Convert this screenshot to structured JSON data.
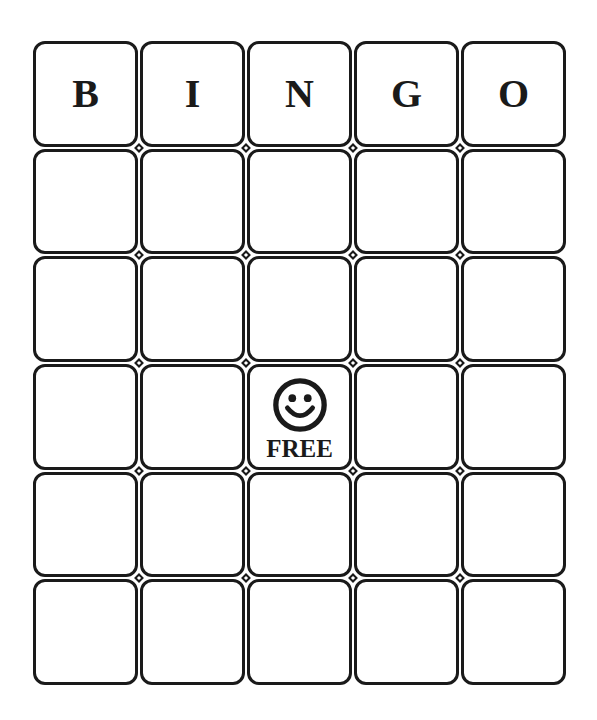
{
  "card": {
    "header": [
      "B",
      "I",
      "N",
      "G",
      "O"
    ],
    "rows": [
      [
        "",
        "",
        "",
        "",
        ""
      ],
      [
        "",
        "",
        "",
        "",
        ""
      ],
      [
        "",
        "",
        "FREE",
        "",
        ""
      ],
      [
        "",
        "",
        "",
        "",
        ""
      ],
      [
        "",
        "",
        "",
        "",
        ""
      ]
    ],
    "free_space": {
      "row": 2,
      "col": 2,
      "label": "FREE",
      "icon": "smiley-face-icon"
    },
    "colors": {
      "line": "#1a1a1a",
      "background": "#ffffff"
    }
  }
}
